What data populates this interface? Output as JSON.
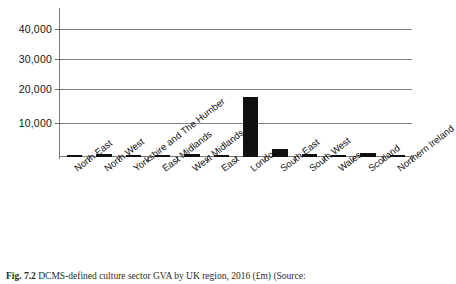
{
  "chart_data": {
    "type": "bar",
    "title": "",
    "xlabel": "",
    "ylabel": "",
    "ylim": [
      0,
      45000
    ],
    "grid": true,
    "legend": "none",
    "yticks": [
      10000,
      20000,
      30000,
      40000
    ],
    "ytick_labels": [
      "10,000",
      "20,000",
      "30,000",
      "40,000"
    ],
    "categories": [
      "North East",
      "North West",
      "Yorkshire and The Humber",
      "East Midlands",
      "West Midlands",
      "East",
      "London",
      "South East",
      "South West",
      "Wales",
      "Scotland",
      "Northern Ireland"
    ],
    "values": [
      300,
      900,
      350,
      450,
      900,
      600,
      18400,
      2500,
      800,
      350,
      1300,
      250
    ]
  },
  "caption": {
    "figure_number": "Fig. 7.2",
    "text": "DCMS-defined culture sector GVA by UK region, 2016 (£m) (Source:"
  }
}
